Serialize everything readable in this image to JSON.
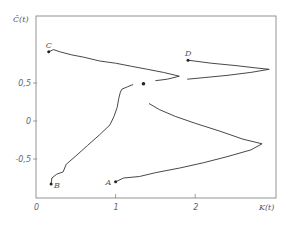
{
  "chart_data": {
    "type": "line",
    "title": "",
    "xlabel": "K(t)",
    "ylabel": "Ĉ(t)",
    "xlim": [
      0,
      3
    ],
    "ylim": [
      -1.0,
      1.05
    ],
    "x_ticks": [
      0,
      1,
      2
    ],
    "x_tick_labels": [
      "0",
      "1",
      "2"
    ],
    "y_ticks": [
      0.5,
      0,
      -0.5
    ],
    "y_tick_labels": [
      "0,5",
      "0",
      "-0,5"
    ],
    "grid": false,
    "legend": null,
    "annotations": [
      {
        "label": "A",
        "x": 1.0,
        "y": -0.8
      },
      {
        "label": "B",
        "x": 0.19,
        "y": -0.83
      },
      {
        "label": "C",
        "x": 0.16,
        "y": 0.91
      },
      {
        "label": "D",
        "x": 1.91,
        "y": 0.8
      }
    ],
    "marker_point": {
      "x": 1.35,
      "y": 0.49
    },
    "series": [
      {
        "name": "path-A",
        "start_label": "A",
        "points": [
          [
            1.0,
            -0.8
          ],
          [
            1.1,
            -0.75
          ],
          [
            1.3,
            -0.73
          ],
          [
            1.5,
            -0.68
          ],
          [
            1.8,
            -0.62
          ],
          [
            2.1,
            -0.55
          ],
          [
            2.4,
            -0.47
          ],
          [
            2.7,
            -0.38
          ],
          [
            2.84,
            -0.3
          ],
          [
            2.6,
            -0.24
          ],
          [
            2.3,
            -0.13
          ],
          [
            2.0,
            -0.03
          ],
          [
            1.75,
            0.06
          ],
          [
            1.55,
            0.15
          ],
          [
            1.42,
            0.23
          ]
        ]
      },
      {
        "name": "path-B",
        "start_label": "B",
        "points": [
          [
            0.19,
            -0.83
          ],
          [
            0.2,
            -0.75
          ],
          [
            0.26,
            -0.7
          ],
          [
            0.34,
            -0.67
          ],
          [
            0.38,
            -0.57
          ],
          [
            0.5,
            -0.46
          ],
          [
            0.65,
            -0.32
          ],
          [
            0.8,
            -0.18
          ],
          [
            0.93,
            -0.05
          ],
          [
            0.98,
            0.06
          ],
          [
            1.02,
            0.18
          ],
          [
            1.04,
            0.3
          ],
          [
            1.06,
            0.38
          ],
          [
            1.08,
            0.42
          ],
          [
            1.15,
            0.45
          ],
          [
            1.22,
            0.48
          ]
        ]
      },
      {
        "name": "path-C",
        "start_label": "C",
        "points": [
          [
            0.16,
            0.91
          ],
          [
            0.22,
            0.94
          ],
          [
            0.3,
            0.91
          ],
          [
            0.45,
            0.87
          ],
          [
            0.6,
            0.84
          ],
          [
            0.8,
            0.79
          ],
          [
            1.0,
            0.76
          ],
          [
            1.2,
            0.72
          ],
          [
            1.4,
            0.68
          ],
          [
            1.6,
            0.64
          ],
          [
            1.8,
            0.59
          ],
          [
            1.65,
            0.55
          ],
          [
            1.5,
            0.53
          ]
        ]
      },
      {
        "name": "path-D",
        "start_label": "D",
        "points": [
          [
            1.91,
            0.8
          ],
          [
            2.2,
            0.76
          ],
          [
            2.5,
            0.73
          ],
          [
            2.75,
            0.7
          ],
          [
            2.93,
            0.68
          ],
          [
            2.7,
            0.64
          ],
          [
            2.4,
            0.6
          ],
          [
            2.1,
            0.57
          ],
          [
            1.9,
            0.55
          ]
        ]
      }
    ]
  }
}
